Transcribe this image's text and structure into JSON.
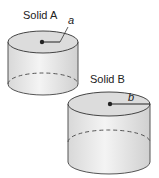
{
  "figure": {
    "solids": [
      {
        "label": "Solid A",
        "radius_label": "a"
      },
      {
        "label": "Solid B",
        "radius_label": "b"
      }
    ]
  }
}
